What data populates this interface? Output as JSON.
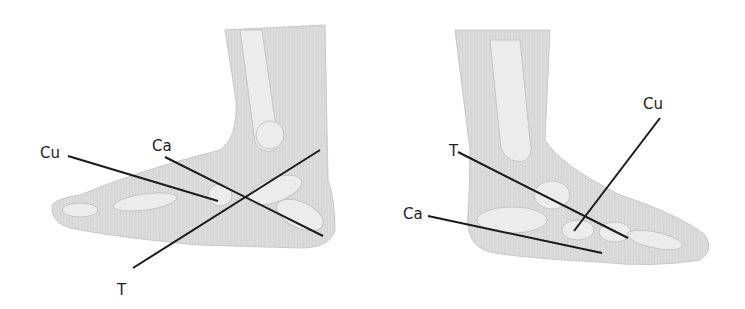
{
  "figure": {
    "left_view": {
      "name": "lateral-view",
      "labels": {
        "cuboid": "Cu",
        "calcaneus": "Ca",
        "talus": "T"
      }
    },
    "right_view": {
      "name": "medial-view",
      "labels": {
        "cuboid": "Cu",
        "calcaneus": "Ca",
        "talus": "T"
      }
    },
    "colors": {
      "skin": "#d9d9d9",
      "bone": "#ececec",
      "line": "#1a1a1a",
      "background": "#ffffff"
    }
  }
}
